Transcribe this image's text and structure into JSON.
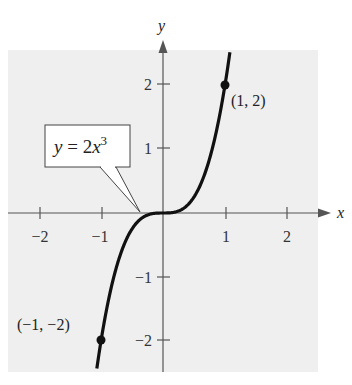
{
  "chart_data": {
    "type": "line",
    "title": "",
    "equation_label": "y = 2x³",
    "equation_parts": {
      "lhs": "y",
      "eq": " = 2",
      "var": "x",
      "exp": "3"
    },
    "xlabel": "x",
    "ylabel": "y",
    "xlim": [
      -2.5,
      2.5
    ],
    "ylim": [
      -2.5,
      2.5
    ],
    "x_ticks": [
      -2,
      -1,
      1,
      2
    ],
    "x_tick_labels": [
      "−2",
      "−1",
      "1",
      "2"
    ],
    "y_ticks": [
      -2,
      -1,
      1,
      2
    ],
    "y_tick_labels": [
      "−2",
      "−1",
      "1",
      "2"
    ],
    "grid": false,
    "background": "#f0f0f0",
    "curve_color": "#111111",
    "series": [
      {
        "name": "y = 2x^3",
        "x": [
          -1.1,
          -1.0,
          -0.8,
          -0.6,
          -0.4,
          -0.2,
          0,
          0.2,
          0.4,
          0.6,
          0.8,
          1.0,
          1.08
        ],
        "y": [
          -2.662,
          -2.0,
          -1.024,
          -0.432,
          -0.128,
          -0.016,
          0,
          0.016,
          0.128,
          0.432,
          1.024,
          2.0,
          2.519
        ]
      }
    ],
    "points": [
      {
        "x": 1,
        "y": 2,
        "label": "(1, 2)"
      },
      {
        "x": -1,
        "y": -2,
        "label": "(−1, −2)"
      }
    ]
  }
}
